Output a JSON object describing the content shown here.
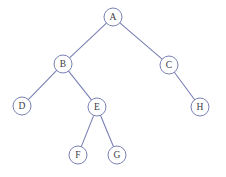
{
  "diagram": {
    "width": 226,
    "height": 177,
    "background_color": "#ffffff"
  },
  "style": {
    "node_stroke_color": "#7a80b4",
    "node_fill_color": "#ffffff",
    "node_stroke_width": 1,
    "node_radius": 9,
    "edge_color": "#7a80b4",
    "edge_width": 1.1,
    "label_color": "#3b3b46",
    "label_font_size": 9.5
  },
  "chart_data": {
    "type": "diagram",
    "subtype": "binary-tree",
    "nodes": [
      {
        "id": "A",
        "label": "A",
        "x": 113,
        "y": 17,
        "depth": 0
      },
      {
        "id": "B",
        "label": "B",
        "x": 63,
        "y": 64,
        "depth": 1
      },
      {
        "id": "C",
        "label": "C",
        "x": 169,
        "y": 65,
        "depth": 1
      },
      {
        "id": "D",
        "label": "D",
        "x": 22,
        "y": 106,
        "depth": 2
      },
      {
        "id": "E",
        "label": "E",
        "x": 97,
        "y": 107,
        "depth": 2
      },
      {
        "id": "H",
        "label": "H",
        "x": 200,
        "y": 107,
        "depth": 2
      },
      {
        "id": "F",
        "label": "F",
        "x": 78,
        "y": 155,
        "depth": 3
      },
      {
        "id": "G",
        "label": "G",
        "x": 117,
        "y": 155,
        "depth": 3
      }
    ],
    "edges": [
      {
        "from": "A",
        "to": "B",
        "side": "left"
      },
      {
        "from": "A",
        "to": "C",
        "side": "right"
      },
      {
        "from": "B",
        "to": "D",
        "side": "left"
      },
      {
        "from": "B",
        "to": "E",
        "side": "right"
      },
      {
        "from": "E",
        "to": "F",
        "side": "left"
      },
      {
        "from": "E",
        "to": "G",
        "side": "right"
      },
      {
        "from": "C",
        "to": "H",
        "side": "right"
      }
    ],
    "root": "A",
    "node_count": 8,
    "edge_count": 7,
    "depth": 4
  }
}
